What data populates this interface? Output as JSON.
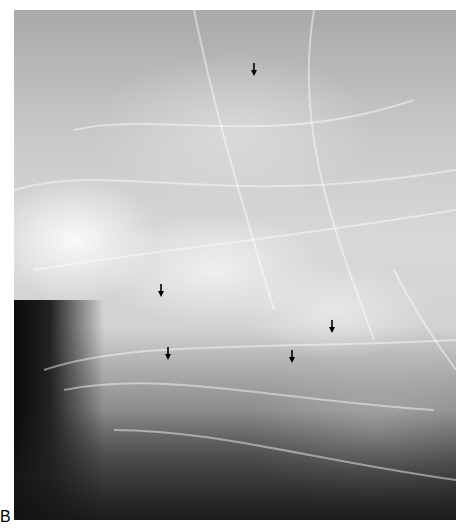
{
  "figure": {
    "panel_label": "B",
    "arrows": [
      {
        "x": 254,
        "y": 70
      },
      {
        "x": 161,
        "y": 291
      },
      {
        "x": 332,
        "y": 327
      },
      {
        "x": 168,
        "y": 354
      },
      {
        "x": 292,
        "y": 357
      }
    ],
    "colors": {
      "arrow": "#000000",
      "background": "#ffffff"
    }
  }
}
